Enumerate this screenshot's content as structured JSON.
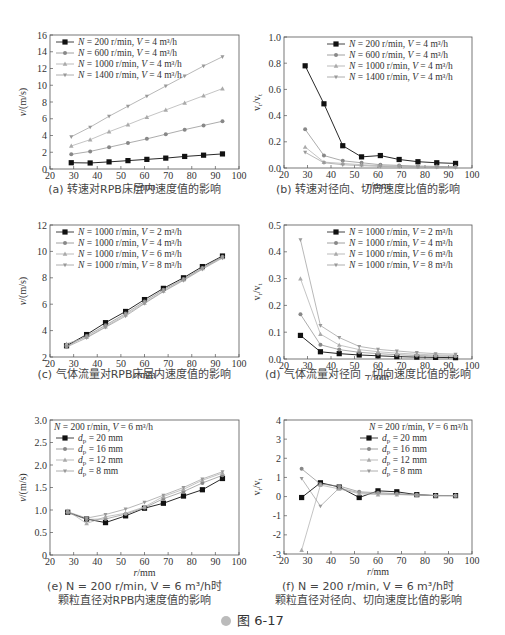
{
  "figure": {
    "label": "图 6-17",
    "icon": "play-circle-icon"
  },
  "chart_data": [
    {
      "id": "a",
      "type": "line",
      "title": "(a) 转速对RPB床层内速度值的影响",
      "caption_lines": [
        "(a) 转速对RPB床层内速度值的影响"
      ],
      "xlabel": "r/mm",
      "ylabel": "v/(m/s)",
      "xlim": [
        20,
        100
      ],
      "ylim": [
        0,
        16
      ],
      "xticks": [
        20,
        30,
        40,
        50,
        60,
        70,
        80,
        90,
        100
      ],
      "yticks": [
        0,
        2,
        4,
        6,
        8,
        10,
        12,
        14,
        16
      ],
      "legend_title": "",
      "legend_position": "top-left",
      "x": [
        29,
        37,
        45,
        53,
        61,
        69,
        77,
        85,
        93
      ],
      "series": [
        {
          "name": "N = 200 r/min, V = 4 m³/h",
          "marker": "square",
          "color": "#111111",
          "values": [
            0.75,
            0.72,
            0.85,
            1.0,
            1.15,
            1.3,
            1.5,
            1.65,
            1.8
          ]
        },
        {
          "name": "N = 600 r/min, V = 4 m³/h",
          "marker": "circle",
          "color": "#888888",
          "values": [
            1.75,
            2.1,
            2.6,
            3.1,
            3.6,
            4.15,
            4.7,
            5.2,
            5.7
          ]
        },
        {
          "name": "N = 1000 r/min, V = 4 m³/h",
          "marker": "triangle",
          "color": "#aaaaaa",
          "values": [
            2.75,
            3.5,
            4.45,
            5.3,
            6.2,
            7.05,
            7.9,
            8.75,
            9.6
          ]
        },
        {
          "name": "N = 1400 r/min, V = 4 m³/h",
          "marker": "star",
          "color": "#999999",
          "values": [
            3.85,
            5.0,
            6.3,
            7.5,
            8.7,
            9.9,
            11.1,
            12.3,
            13.4
          ]
        }
      ]
    },
    {
      "id": "b",
      "type": "line",
      "title": "(b) 转速对径向、切向速度比值的影响",
      "caption_lines": [
        "(b) 转速对径向、切向速度比值的影响"
      ],
      "xlabel": "r/mm",
      "ylabel": "vr/vt",
      "xlim": [
        20,
        100
      ],
      "ylim": [
        0,
        1.0
      ],
      "xticks": [
        20,
        30,
        40,
        50,
        60,
        70,
        80,
        90,
        100
      ],
      "yticks": [
        "0.0",
        "0.2",
        "0.4",
        "0.6",
        "0.8",
        "1.0"
      ],
      "legend_title": "",
      "legend_position": "top-right",
      "x": [
        29,
        37,
        45,
        53,
        61,
        69,
        77,
        85,
        93
      ],
      "series": [
        {
          "name": "N = 200 r/min, V = 4 m³/h",
          "marker": "square",
          "color": "#111111",
          "values": [
            0.78,
            0.49,
            0.17,
            0.085,
            0.095,
            0.065,
            0.048,
            0.04,
            0.035
          ]
        },
        {
          "name": "N = 600 r/min, V = 4 m³/h",
          "marker": "circle",
          "color": "#888888",
          "values": [
            0.295,
            0.095,
            0.055,
            0.04,
            0.025,
            0.02,
            0.015,
            0.012,
            0.01
          ]
        },
        {
          "name": "N = 1000 r/min, V = 4 m³/h",
          "marker": "triangle",
          "color": "#aaaaaa",
          "values": [
            0.16,
            0.045,
            0.035,
            0.025,
            0.018,
            0.014,
            0.01,
            0.008,
            0.006
          ]
        },
        {
          "name": "N = 1400 r/min, V = 4 m³/h",
          "marker": "star",
          "color": "#999999",
          "values": [
            0.12,
            0.04,
            0.025,
            0.018,
            0.012,
            0.009,
            0.007,
            0.005,
            0.004
          ]
        }
      ]
    },
    {
      "id": "c",
      "type": "line",
      "title": "(c) 气体流量对RPB床层内速度值的影响",
      "caption_lines": [
        "(c) 气体流量对RPB床层内速度值的影响"
      ],
      "xlabel": "r/mm",
      "ylabel": "v/(m/s)",
      "xlim": [
        20,
        100
      ],
      "ylim": [
        2,
        12
      ],
      "xticks": [
        20,
        30,
        40,
        50,
        60,
        70,
        80,
        90,
        100
      ],
      "yticks": [
        2,
        4,
        6,
        8,
        10,
        12
      ],
      "legend_title": "",
      "legend_position": "top-left",
      "x": [
        27,
        35.5,
        43.5,
        52,
        60,
        68,
        76.5,
        84.5,
        93
      ],
      "series": [
        {
          "name": "N = 1000 r/min, V = 2 m³/h",
          "marker": "square",
          "color": "#111111",
          "values": [
            2.85,
            3.7,
            4.6,
            5.45,
            6.35,
            7.2,
            8.0,
            8.85,
            9.65
          ]
        },
        {
          "name": "N = 1000 r/min, V = 4 m³/h",
          "marker": "circle",
          "color": "#888888",
          "values": [
            2.8,
            3.6,
            4.4,
            5.3,
            6.2,
            7.1,
            7.9,
            8.75,
            9.6
          ]
        },
        {
          "name": "N = 1000 r/min, V = 6 m³/h",
          "marker": "triangle",
          "color": "#aaaaaa",
          "values": [
            3.0,
            3.5,
            4.3,
            5.2,
            6.1,
            7.0,
            7.85,
            8.7,
            9.55
          ]
        },
        {
          "name": "N = 1000 r/min, V = 8 m³/h",
          "marker": "star",
          "color": "#999999",
          "values": [
            2.75,
            3.45,
            4.25,
            5.1,
            6.05,
            6.95,
            7.8,
            8.65,
            9.5
          ]
        }
      ]
    },
    {
      "id": "d",
      "type": "line",
      "title": "(d) 气体流量对径向、切向速度比值的影响",
      "caption_lines": [
        "(d) 气体流量对径向 - 切向速度比值的影响"
      ],
      "xlabel": "r/mm",
      "ylabel": "vr/vt",
      "xlim": [
        20,
        100
      ],
      "ylim": [
        0,
        0.5
      ],
      "xticks": [
        20,
        30,
        40,
        50,
        60,
        70,
        80,
        90,
        100
      ],
      "yticks": [
        "0.0",
        "0.1",
        "0.2",
        "0.3",
        "0.4",
        "0.5"
      ],
      "legend_title": "",
      "legend_position": "top-right",
      "x": [
        27,
        35.5,
        43.5,
        52,
        60,
        68,
        76.5,
        84.5,
        93
      ],
      "series": [
        {
          "name": "N = 1000 r/min, V = 2 m³/h",
          "marker": "square",
          "color": "#111111",
          "values": [
            0.088,
            0.027,
            0.02,
            0.015,
            0.012,
            0.009,
            0.007,
            0.006,
            0.005
          ]
        },
        {
          "name": "N = 1000 r/min, V = 4 m³/h",
          "marker": "circle",
          "color": "#888888",
          "values": [
            0.167,
            0.053,
            0.035,
            0.025,
            0.02,
            0.016,
            0.013,
            0.011,
            0.01
          ]
        },
        {
          "name": "N = 1000 r/min, V = 6 m³/h",
          "marker": "triangle",
          "color": "#aaaaaa",
          "values": [
            0.3,
            0.093,
            0.052,
            0.035,
            0.027,
            0.022,
            0.018,
            0.015,
            0.013
          ]
        },
        {
          "name": "N = 1000 r/min, V = 8 m³/h",
          "marker": "star",
          "color": "#999999",
          "values": [
            0.445,
            0.125,
            0.08,
            0.047,
            0.036,
            0.03,
            0.024,
            0.02,
            0.018
          ]
        }
      ]
    },
    {
      "id": "e",
      "type": "line",
      "title": "(e) N = 200 r/min, V = 6 m³/h时 颗粒直径对RPB内速度值的影响",
      "caption_lines": [
        "(e) N = 200 r/min, V = 6 m³/h时",
        "颗粒直径对RPB内速度值的影响"
      ],
      "xlabel": "r/mm",
      "ylabel": "v/(m/s)",
      "xlim": [
        20,
        100
      ],
      "ylim": [
        0,
        3.0
      ],
      "xticks": [
        20,
        30,
        40,
        50,
        60,
        70,
        80,
        90,
        100
      ],
      "yticks": [
        "0",
        "0.5",
        "1.0",
        "1.5",
        "2.0",
        "2.5",
        "3.0"
      ],
      "legend_title": "N = 200 r/min, V = 6 m³/h",
      "legend_position": "top-left",
      "x": [
        27.5,
        35.5,
        43.5,
        52,
        60,
        68,
        76.5,
        84.5,
        93
      ],
      "series": [
        {
          "name": "dp = 20 mm",
          "marker": "square",
          "color": "#111111",
          "values": [
            0.95,
            0.8,
            0.72,
            0.87,
            1.04,
            1.15,
            1.31,
            1.45,
            1.7
          ]
        },
        {
          "name": "dp = 16 mm",
          "marker": "circle",
          "color": "#888888",
          "values": [
            0.94,
            0.79,
            0.8,
            0.91,
            1.05,
            1.25,
            1.41,
            1.6,
            1.77
          ]
        },
        {
          "name": "dp = 12 mm",
          "marker": "triangle",
          "color": "#aaaaaa",
          "values": [
            0.98,
            0.7,
            0.85,
            0.93,
            1.07,
            1.3,
            1.46,
            1.66,
            1.82
          ]
        },
        {
          "name": "dp = 8 mm",
          "marker": "star",
          "color": "#999999",
          "values": [
            0.96,
            0.82,
            0.9,
            1.02,
            1.17,
            1.33,
            1.5,
            1.69,
            1.85
          ]
        }
      ]
    },
    {
      "id": "f",
      "type": "line",
      "title": "(f) N = 200 r/min, V = 6 m³/h时 颗粒直径对径向、切向速度比值的影响",
      "caption_lines": [
        "(f) N = 200 r/min, V = 6 m³/h时",
        "颗粒直径对径向、切向速度比值的影响"
      ],
      "xlabel": "r/mm",
      "ylabel": "vr/vt",
      "xlim": [
        20,
        100
      ],
      "ylim": [
        -3,
        4
      ],
      "xticks": [
        20,
        30,
        40,
        50,
        60,
        70,
        80,
        90,
        100
      ],
      "yticks": [
        -3,
        -2,
        -1,
        0,
        1,
        2,
        3,
        4
      ],
      "legend_title": "N = 200 r/min, V = 6 m³/h",
      "legend_position": "top-right",
      "x": [
        27.5,
        35.5,
        43.5,
        52,
        60,
        68,
        76.5,
        84.5,
        93
      ],
      "series": [
        {
          "name": "dp = 20 mm",
          "marker": "square",
          "color": "#111111",
          "values": [
            -0.05,
            0.72,
            0.5,
            -0.05,
            0.3,
            0.25,
            0.1,
            0.05,
            0.05
          ]
        },
        {
          "name": "dp = 16 mm",
          "marker": "circle",
          "color": "#888888",
          "values": [
            1.45,
            0.65,
            0.55,
            0.25,
            0.2,
            0.15,
            0.1,
            0.05,
            0.05
          ]
        },
        {
          "name": "dp = 12 mm",
          "marker": "triangle",
          "color": "#aaaaaa",
          "values": [
            -2.8,
            0.6,
            0.4,
            0.15,
            0.1,
            0.1,
            0.08,
            0.05,
            0.05
          ]
        },
        {
          "name": "dp = 8 mm",
          "marker": "star",
          "color": "#999999",
          "values": [
            0.95,
            -0.5,
            0.45,
            0.2,
            0.15,
            0.12,
            0.08,
            0.06,
            0.05
          ]
        }
      ]
    }
  ],
  "layout": {
    "panels": [
      {
        "id": "a",
        "frame": [
          50,
          35,
          239,
          169
        ],
        "caption_top": 183
      },
      {
        "id": "b",
        "frame": [
          284,
          37,
          472,
          168
        ],
        "caption_top": 183
      },
      {
        "id": "c",
        "frame": [
          50,
          225,
          239,
          357
        ],
        "caption_top": 368
      },
      {
        "id": "d",
        "frame": [
          284,
          225,
          472,
          359
        ],
        "caption_top": 368
      },
      {
        "id": "e",
        "frame": [
          50,
          420,
          239,
          555
        ],
        "caption_top": 580
      },
      {
        "id": "f",
        "frame": [
          284,
          420,
          472,
          554
        ],
        "caption_top": 580
      }
    ]
  }
}
